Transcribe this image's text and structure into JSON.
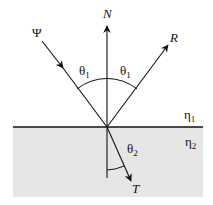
{
  "diagram": {
    "labels": {
      "normal": "N",
      "incident": "Ψ",
      "reflected": "R",
      "transmitted": "T",
      "incident_angle_left": "θ",
      "incident_angle_left_sub": "1",
      "reflected_angle_right": "θ",
      "reflected_angle_right_sub": "1",
      "transmitted_angle": "θ",
      "transmitted_angle_sub": "2",
      "medium_top": "η",
      "medium_top_sub": "1",
      "medium_bottom": "η",
      "medium_bottom_sub": "2"
    },
    "colors": {
      "line": "#111111",
      "lower_medium": "#e6e6e6",
      "background": "#ffffff"
    }
  }
}
